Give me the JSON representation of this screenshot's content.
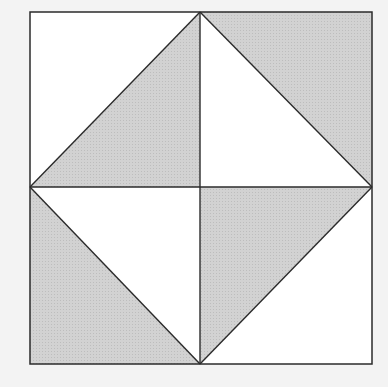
{
  "diagram": {
    "type": "geometric-tiling",
    "colors": {
      "background": "#f3f3f3",
      "unshaded": "#ffffff",
      "shaded": "#d2d2d2",
      "shade_dot": "#bdbdbd",
      "stroke": "#2b2b2b"
    },
    "outer_square": {
      "x1": 30,
      "y1": 12,
      "x2": 372,
      "y2": 364
    },
    "center": {
      "x": 200,
      "y": 187
    },
    "vertices": {
      "top_left": [
        30,
        12
      ],
      "top_mid": [
        200,
        12
      ],
      "top_right": [
        372,
        12
      ],
      "left_mid": [
        30,
        187
      ],
      "center": [
        200,
        187
      ],
      "right_mid": [
        372,
        187
      ],
      "bottom_left": [
        30,
        364
      ],
      "bottom_mid": [
        200,
        364
      ],
      "bottom_right": [
        372,
        364
      ]
    },
    "quadrants": [
      {
        "name": "top-left",
        "diagonal": [
          [
            30,
            187
          ],
          [
            200,
            12
          ]
        ],
        "shaded_triangle": [
          [
            30,
            187
          ],
          [
            200,
            12
          ],
          [
            200,
            187
          ]
        ],
        "unshaded_triangle": [
          [
            30,
            12
          ],
          [
            200,
            12
          ],
          [
            30,
            187
          ]
        ],
        "shaded_side": "lower-right"
      },
      {
        "name": "top-right",
        "diagonal": [
          [
            200,
            12
          ],
          [
            372,
            187
          ]
        ],
        "shaded_triangle": [
          [
            200,
            12
          ],
          [
            372,
            12
          ],
          [
            372,
            187
          ]
        ],
        "unshaded_triangle": [
          [
            200,
            12
          ],
          [
            372,
            187
          ],
          [
            200,
            187
          ]
        ],
        "shaded_side": "upper-right"
      },
      {
        "name": "bottom-left",
        "diagonal": [
          [
            30,
            187
          ],
          [
            200,
            364
          ]
        ],
        "shaded_triangle": [
          [
            30,
            187
          ],
          [
            200,
            364
          ],
          [
            30,
            364
          ]
        ],
        "unshaded_triangle": [
          [
            30,
            187
          ],
          [
            200,
            187
          ],
          [
            200,
            364
          ]
        ],
        "shaded_side": "lower-left"
      },
      {
        "name": "bottom-right",
        "diagonal": [
          [
            372,
            187
          ],
          [
            200,
            364
          ]
        ],
        "shaded_triangle": [
          [
            200,
            187
          ],
          [
            372,
            187
          ],
          [
            200,
            364
          ]
        ],
        "unshaded_triangle": [
          [
            372,
            187
          ],
          [
            372,
            364
          ],
          [
            200,
            364
          ]
        ],
        "shaded_side": "upper-left"
      }
    ]
  }
}
